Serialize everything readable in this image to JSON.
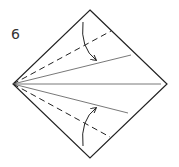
{
  "step": {
    "number": "6"
  },
  "colors": {
    "line": "#222222",
    "crease": "#555555",
    "background": "#ffffff"
  },
  "diagram": {
    "square_vertices": {
      "top": [
        90,
        10
      ],
      "right": [
        167,
        84
      ],
      "bottom": [
        90,
        158
      ],
      "left": [
        13,
        84
      ]
    },
    "lines": [
      {
        "type": "dashed",
        "role": "valley-fold-upper",
        "from": [
          13,
          84
        ],
        "to": [
          111,
          31
        ]
      },
      {
        "type": "solid",
        "role": "crease-upper",
        "from": [
          13,
          84
        ],
        "to": [
          131,
          55
        ]
      },
      {
        "type": "solid",
        "role": "crease-center",
        "from": [
          13,
          84
        ],
        "to": [
          161,
          84
        ]
      },
      {
        "type": "solid",
        "role": "crease-lower",
        "from": [
          13,
          84
        ],
        "to": [
          128,
          113
        ]
      },
      {
        "type": "dashed",
        "role": "valley-fold-lower",
        "from": [
          13,
          84
        ],
        "to": [
          110,
          137
        ]
      }
    ],
    "arrows": [
      {
        "role": "fold-arrow-down",
        "from": [
          83,
          22
        ],
        "to": [
          96,
          60
        ]
      },
      {
        "role": "fold-arrow-up",
        "from": [
          83,
          146
        ],
        "to": [
          96,
          108
        ]
      }
    ]
  }
}
